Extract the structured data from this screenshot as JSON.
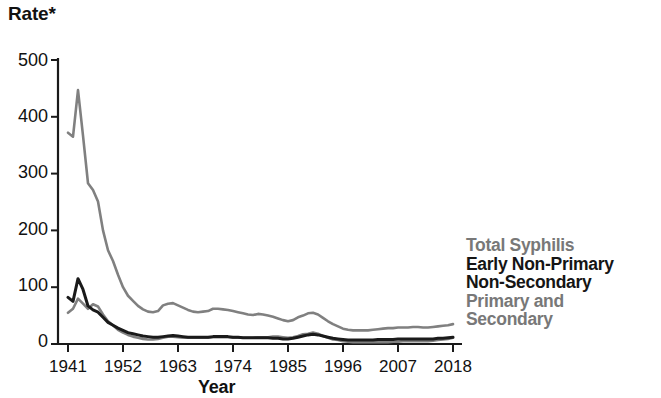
{
  "title": {
    "y_axis_label": "Rate*",
    "x_axis_label": "Year"
  },
  "axes": {
    "y_ticks": [
      "500",
      "400",
      "300",
      "200",
      "100",
      "0"
    ],
    "x_ticks": [
      "1941",
      "1952",
      "1963",
      "1974",
      "1985",
      "1996",
      "2007",
      "2018"
    ]
  },
  "legend": {
    "total": "Total Syphilis",
    "early_line1": "Early Non-Primary",
    "early_line2": "Non-Secondary",
    "ps_line1": "Primary and",
    "ps_line2": "Secondary"
  },
  "colors": {
    "total_syphilis": "#808080",
    "early_non_primary_non_secondary": "#1a1a1a",
    "primary_and_secondary": "#808080",
    "axis": "#1a1a1a",
    "background": "#ffffff"
  },
  "chart_data": {
    "type": "line",
    "title": "",
    "subtitle": "",
    "xlabel": "Year",
    "ylabel": "Rate*",
    "xlim": [
      1941,
      2018
    ],
    "ylim": [
      0,
      500
    ],
    "grid": false,
    "legend_position": "right",
    "x": [
      1941,
      1942,
      1943,
      1944,
      1945,
      1946,
      1947,
      1948,
      1949,
      1950,
      1951,
      1952,
      1953,
      1954,
      1955,
      1956,
      1957,
      1958,
      1959,
      1960,
      1961,
      1962,
      1963,
      1964,
      1965,
      1966,
      1967,
      1968,
      1969,
      1970,
      1971,
      1972,
      1973,
      1974,
      1975,
      1976,
      1977,
      1978,
      1979,
      1980,
      1981,
      1982,
      1983,
      1984,
      1985,
      1986,
      1987,
      1988,
      1989,
      1990,
      1991,
      1992,
      1993,
      1994,
      1995,
      1996,
      1997,
      1998,
      1999,
      2000,
      2001,
      2002,
      2003,
      2004,
      2005,
      2006,
      2007,
      2008,
      2009,
      2010,
      2011,
      2012,
      2013,
      2014,
      2015,
      2016,
      2017,
      2018
    ],
    "series": [
      {
        "name": "Total Syphilis",
        "color": "#808080",
        "values": [
          372,
          365,
          447,
          367,
          283,
          271,
          251,
          200,
          165,
          146,
          122,
          100,
          85,
          76,
          67,
          61,
          57,
          56,
          58,
          68,
          71,
          72,
          68,
          64,
          60,
          57,
          56,
          57,
          58,
          62,
          62,
          61,
          60,
          58,
          56,
          54,
          52,
          51,
          53,
          52,
          50,
          48,
          45,
          42,
          40,
          42,
          47,
          50,
          54,
          55,
          52,
          46,
          40,
          35,
          31,
          27,
          25,
          24,
          24,
          24,
          24,
          25,
          26,
          27,
          28,
          28,
          29,
          29,
          29,
          30,
          30,
          29,
          29,
          30,
          31,
          32,
          33,
          35
        ]
      },
      {
        "name": "Early Non-Primary Non-Secondary",
        "color": "#1a1a1a",
        "values": [
          82,
          75,
          115,
          96,
          67,
          60,
          56,
          47,
          38,
          33,
          28,
          24,
          20,
          18,
          16,
          14,
          13,
          12,
          12,
          13,
          14,
          15,
          14,
          13,
          12,
          12,
          12,
          12,
          12,
          13,
          13,
          13,
          13,
          12,
          12,
          11,
          11,
          11,
          11,
          11,
          11,
          10,
          10,
          9,
          9,
          10,
          12,
          14,
          16,
          17,
          16,
          14,
          12,
          10,
          9,
          8,
          7,
          7,
          7,
          7,
          7,
          7,
          8,
          8,
          8,
          8,
          9,
          9,
          9,
          9,
          9,
          9,
          9,
          9,
          10,
          10,
          11,
          12
        ]
      },
      {
        "name": "Primary and Secondary",
        "color": "#808080",
        "values": [
          55,
          62,
          80,
          71,
          62,
          70,
          66,
          52,
          40,
          33,
          25,
          20,
          16,
          13,
          11,
          9,
          8,
          8,
          9,
          11,
          13,
          13,
          12,
          11,
          11,
          11,
          11,
          11,
          11,
          12,
          12,
          12,
          12,
          11,
          11,
          11,
          11,
          11,
          12,
          12,
          12,
          13,
          13,
          12,
          11,
          12,
          14,
          17,
          18,
          20,
          18,
          14,
          11,
          8,
          7,
          5,
          4,
          3,
          3,
          3,
          3,
          3,
          3,
          3,
          3,
          4,
          4,
          5,
          5,
          5,
          5,
          5,
          5,
          6,
          7,
          8,
          9,
          11
        ]
      }
    ]
  }
}
